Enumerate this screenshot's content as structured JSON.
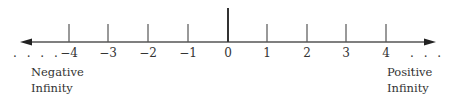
{
  "diagram": {
    "type": "number-line",
    "ticks": [
      {
        "value": -4,
        "label": "−4",
        "x": 69
      },
      {
        "value": -3,
        "label": "−3",
        "x": 108
      },
      {
        "value": -2,
        "label": "−2",
        "x": 148
      },
      {
        "value": -1,
        "label": "−1",
        "x": 188
      },
      {
        "value": 0,
        "label": "0",
        "x": 228
      },
      {
        "value": 1,
        "label": "1",
        "x": 267
      },
      {
        "value": 2,
        "label": "2",
        "x": 307
      },
      {
        "value": 3,
        "label": "3",
        "x": 346
      },
      {
        "value": 4,
        "label": "4",
        "x": 386
      }
    ],
    "left_dots": ". . . .",
    "right_dots": ". . . .",
    "negative_label_line1": "Negative",
    "negative_label_line2": "Infinity",
    "positive_label_line1": "Positive",
    "positive_label_line2": "Infinity",
    "line_color": "#555555"
  }
}
